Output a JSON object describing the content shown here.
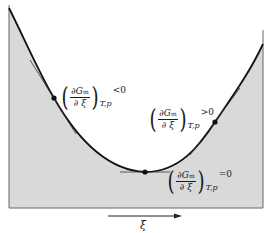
{
  "diagram": {
    "title": "",
    "axis": {
      "x_label": "ξ",
      "arrow_direction": "right"
    },
    "curve_label": "G vs extent of reaction",
    "annotations": [
      {
        "id": "left",
        "numerator": "∂G",
        "numerator_sub": "m",
        "denominator": "∂ ξ",
        "subscript": "T,p",
        "relation": "<0"
      },
      {
        "id": "right",
        "numerator": "∂G",
        "numerator_sub": "m",
        "denominator": "∂ ξ",
        "subscript": "T,p",
        "relation": ">0"
      },
      {
        "id": "minimum",
        "numerator": "∂G",
        "numerator_sub": "m",
        "denominator": "∂ ξ",
        "subscript": "T,p",
        "relation": "=0"
      }
    ],
    "colors": {
      "shade": "#d9d9d9",
      "curve": "#111111",
      "frame": "#555555",
      "background": "#ffffff"
    }
  }
}
